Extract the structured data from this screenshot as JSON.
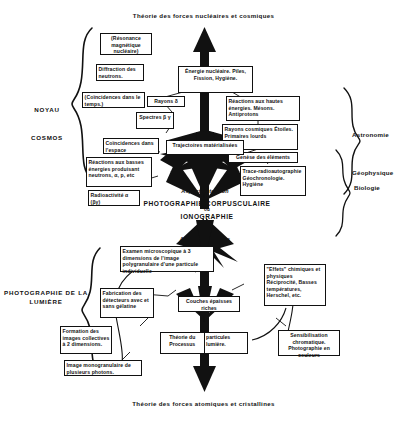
{
  "titles": {
    "top": "Théorie des forces nucléaires et cosmiques",
    "bottom": "Théorie des forces atomiques et cristallines"
  },
  "center": {
    "line1": "PHOTOGRAPHIE CORPUSCULAIRE",
    "line2": "ou",
    "line3": "IONOGRAPHIE",
    "aspect_detection": "Aspect détection",
    "aspect_processus": "Aspect processus",
    "trajectories": "Trajectoires matérialisées"
  },
  "side_labels": {
    "left_top_1": "NOYAU",
    "left_top_2": "COSMOS",
    "left_bottom": "PHOTOGRAPHIE DE LA LUMIÈRE",
    "right_1": "Astronomie",
    "right_2": "Géophysique",
    "right_3": "Biologie"
  },
  "boxes": {
    "resonance": "(Résonance magnétique nucléaire)",
    "diffraction": "Diffraction des neutrons.",
    "coincidences_temps": "(Coïncidences dans le temps.)",
    "rayons_delta": "Rayons δ",
    "spectres": "Spectres β γ",
    "coincidences_espace": "Coïncidences dans l'espace",
    "reactions_basses": "Réactions aux basses énergies produisant neutrons, α, p, etc",
    "radioactivite": "Radioactivité α (βγ)",
    "energie_nucleaire": "Énergie nucléaire. Piles, Fission, Hygiène.",
    "reactions_hautes": "Réactions aux hautes énergies. Mésons. Antiprotons",
    "rayons_cosmiques": "Rayons cosmiques Étoiles. Primaires lourds",
    "genese": "Genèse des éléments",
    "trace_radio": "Trace-radioautographie Géochronologie. Hygiène",
    "examen_microscopique": "Examen microscopique à 3 dimensions de l'image polygranulaire d'une particule individuelle",
    "couches_epaisses": "Couches épaisses riches",
    "effets_chimiques": "\"Effets\" chimiques et physiques Réciprocité, Basses températures, Herschel, etc.",
    "sensibilisation": "Sensibilisation chromatique. Photographie en couleurs",
    "fabrication": "Fabrication des détecteurs avec et sans gélatine",
    "formation_images": "Formation des images collectives à 2 dimensions.",
    "image_monogranulaire": "Image monogranulaire de plusieurs photons.",
    "theorie_processus_left": "Théorie du Processus",
    "theorie_processus_right": "particules lumière."
  },
  "colors": {
    "ink": "#111111",
    "paper": "#ffffff"
  }
}
